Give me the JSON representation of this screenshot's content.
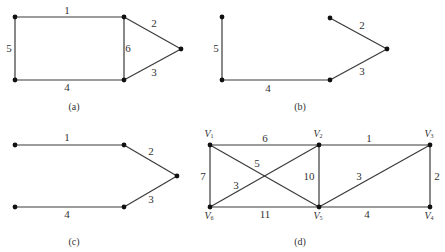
{
  "figures": [
    {
      "id": "a",
      "caption": "(a)",
      "caption_pos": [
        74,
        108
      ],
      "nodes": [
        [
          15,
          17
        ],
        [
          124,
          17
        ],
        [
          181,
          49
        ],
        [
          124,
          80
        ],
        [
          15,
          80
        ]
      ],
      "edges": [
        {
          "from": 0,
          "to": 1,
          "label": "1",
          "lx": 67,
          "ly": 11
        },
        {
          "from": 1,
          "to": 2,
          "label": "2",
          "lx": 154,
          "ly": 24
        },
        {
          "from": 2,
          "to": 3,
          "label": "3",
          "lx": 154,
          "ly": 73
        },
        {
          "from": 3,
          "to": 4,
          "label": "4",
          "lx": 67,
          "ly": 88
        },
        {
          "from": 4,
          "to": 0,
          "label": "5",
          "lx": 9,
          "ly": 49
        },
        {
          "from": 1,
          "to": 3,
          "label": "6",
          "lx": 128,
          "ly": 49
        }
      ]
    },
    {
      "id": "b",
      "caption": "(b)",
      "caption_pos": [
        300,
        108
      ],
      "nodes": [
        [
          222,
          17
        ],
        [
          330,
          18
        ],
        [
          387,
          49
        ],
        [
          330,
          80
        ],
        [
          222,
          80
        ]
      ],
      "edges": [
        {
          "from": 0,
          "to": 4,
          "label": "5",
          "lx": 216,
          "ly": 49
        },
        {
          "from": 1,
          "to": 2,
          "label": "2",
          "lx": 362,
          "ly": 26
        },
        {
          "from": 2,
          "to": 3,
          "label": "3",
          "lx": 362,
          "ly": 72
        },
        {
          "from": 3,
          "to": 4,
          "label": "4",
          "lx": 268,
          "ly": 89
        }
      ]
    },
    {
      "id": "c",
      "caption": "(c)",
      "caption_pos": [
        74,
        243
      ],
      "nodes": [
        [
          15,
          145
        ],
        [
          124,
          145
        ],
        [
          177,
          176
        ],
        [
          124,
          207
        ],
        [
          15,
          207
        ]
      ],
      "edges": [
        {
          "from": 0,
          "to": 1,
          "label": "1",
          "lx": 67,
          "ly": 138
        },
        {
          "from": 1,
          "to": 2,
          "label": "2",
          "lx": 151,
          "ly": 152
        },
        {
          "from": 2,
          "to": 3,
          "label": "3",
          "lx": 151,
          "ly": 200
        },
        {
          "from": 3,
          "to": 4,
          "label": "4",
          "lx": 67,
          "ly": 215
        }
      ]
    },
    {
      "id": "d",
      "caption": "(d)",
      "caption_pos": [
        300,
        243
      ],
      "nodes": [
        {
          "name": "V",
          "sub": "1",
          "x": 210,
          "y": 145,
          "lx": 209,
          "ly": 135
        },
        {
          "name": "V",
          "sub": "2",
          "x": 319,
          "y": 145,
          "lx": 318,
          "ly": 135
        },
        {
          "name": "V",
          "sub": "3",
          "x": 430,
          "y": 145,
          "lx": 429,
          "ly": 135
        },
        {
          "name": "V",
          "sub": "4",
          "x": 430,
          "y": 207,
          "lx": 429,
          "ly": 217
        },
        {
          "name": "V",
          "sub": "5",
          "x": 319,
          "y": 207,
          "lx": 318,
          "ly": 217
        },
        {
          "name": "V",
          "sub": "6",
          "x": 210,
          "y": 207,
          "lx": 209,
          "ly": 217
        }
      ],
      "edges": [
        {
          "from": 0,
          "to": 1,
          "label": "6",
          "lx": 265,
          "ly": 139
        },
        {
          "from": 1,
          "to": 2,
          "label": "1",
          "lx": 369,
          "ly": 139
        },
        {
          "from": 0,
          "to": 4,
          "label": "5",
          "lx": 257,
          "ly": 164
        },
        {
          "from": 0,
          "to": 5,
          "label": "7",
          "lx": 203,
          "ly": 177
        },
        {
          "from": 1,
          "to": 4,
          "label": "10",
          "lx": 309,
          "ly": 177
        },
        {
          "from": 5,
          "to": 1,
          "label": "3",
          "lx": 236,
          "ly": 186
        },
        {
          "from": 4,
          "to": 2,
          "label": "3",
          "lx": 359,
          "ly": 177
        },
        {
          "from": 2,
          "to": 3,
          "label": "2",
          "lx": 437,
          "ly": 177
        },
        {
          "from": 5,
          "to": 4,
          "label": "11",
          "lx": 265,
          "ly": 215
        },
        {
          "from": 4,
          "to": 3,
          "label": "4",
          "lx": 367,
          "ly": 215
        }
      ]
    }
  ]
}
